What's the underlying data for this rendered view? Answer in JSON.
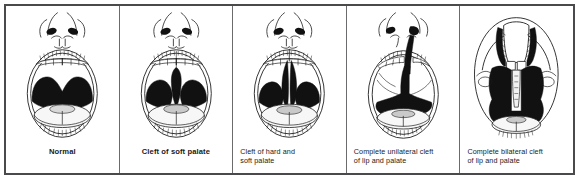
{
  "figure": {
    "kind": "medical-illustration",
    "orientation": "frontal intraoral view",
    "panel_count": 5,
    "colors": {
      "outer_border": "#4a4a4d",
      "panel_divider": "#6b6b6e",
      "background": "#ffffff",
      "line_art": "#1a1a1a",
      "cleft_fill": "#111111",
      "tongue_fill": "#f2f2f2",
      "caption_text": "#1a1a1a"
    },
    "panels": [
      {
        "id": "normal",
        "caption_lines": [
          "Normal"
        ],
        "caption_bold": true,
        "caption_align": "center",
        "anatomy": {
          "nose_visible": true,
          "nostrils": 2,
          "upper_lip_intact": true,
          "upper_teeth_row": true,
          "palate_shape": "two-lobed intact palate",
          "cleft_present": false,
          "cleft_extent": "none",
          "tongue_visible": true
        }
      },
      {
        "id": "cleft-soft-palate",
        "caption_lines": [
          "Cleft of soft palate"
        ],
        "caption_bold": false,
        "caption_align": "center",
        "anatomy": {
          "nose_visible": true,
          "nostrils": 2,
          "upper_lip_intact": true,
          "upper_teeth_row": true,
          "palate_shape": "split posterior palate",
          "cleft_present": true,
          "cleft_extent": "soft palate only",
          "cleft_laterality": "midline",
          "tongue_visible": true
        }
      },
      {
        "id": "cleft-hard-and-soft-palate",
        "caption_lines": [
          "Cleft of hard and",
          "soft palate"
        ],
        "caption_bold": false,
        "caption_align": "left",
        "anatomy": {
          "nose_visible": true,
          "nostrils": 2,
          "upper_lip_intact": true,
          "upper_teeth_row": true,
          "palate_shape": "split anterior and posterior palate",
          "cleft_present": true,
          "cleft_extent": "hard and soft palate",
          "cleft_laterality": "midline",
          "tongue_visible": true
        }
      },
      {
        "id": "complete-unilateral-cleft",
        "caption_lines": [
          "Complete unilateral cleft",
          "of lip and palate"
        ],
        "caption_bold": false,
        "caption_align": "left",
        "anatomy": {
          "nose_visible": true,
          "nostrils": 2,
          "upper_lip_intact": false,
          "upper_teeth_row": true,
          "palate_shape": "one wide continuous cleft to nostril",
          "cleft_present": true,
          "cleft_extent": "lip, alveolus, hard and soft palate",
          "cleft_laterality": "unilateral",
          "tongue_visible": true
        }
      },
      {
        "id": "complete-bilateral-cleft",
        "caption_lines": [
          "Complete bilateral cleft",
          "of lip and palate"
        ],
        "caption_bold": false,
        "caption_align": "left",
        "anatomy": {
          "nose_visible": true,
          "nostrils": 2,
          "upper_lip_intact": false,
          "upper_teeth_row": true,
          "palate_shape": "central premaxillary segment with clefts on both sides",
          "cleft_present": true,
          "cleft_extent": "lip, alveolus, hard and soft palate, both sides",
          "cleft_laterality": "bilateral",
          "tongue_visible": true
        }
      }
    ]
  }
}
